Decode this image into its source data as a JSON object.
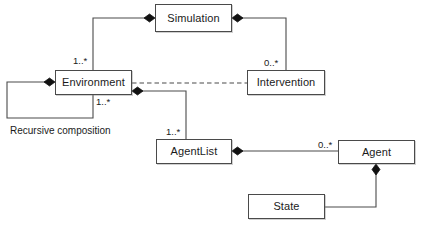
{
  "diagram": {
    "kind": "uml-class-diagram",
    "width": 423,
    "height": 228,
    "background_color": "#ffffff",
    "line_color": "#4a4a4a",
    "text_color": "#1a1a1a",
    "classes": [
      {
        "id": "simulation",
        "name": "Simulation",
        "x": 155,
        "y": 4,
        "w": 77,
        "h": 28
      },
      {
        "id": "environment",
        "name": "Environment",
        "x": 55,
        "y": 70,
        "w": 77,
        "h": 25
      },
      {
        "id": "intervention",
        "name": "Intervention",
        "x": 247,
        "y": 70,
        "w": 78,
        "h": 25
      },
      {
        "id": "agentlist",
        "name": "AgentList",
        "x": 156,
        "y": 139,
        "w": 76,
        "h": 25
      },
      {
        "id": "agent",
        "name": "Agent",
        "x": 338,
        "y": 140,
        "w": 77,
        "h": 24
      },
      {
        "id": "state",
        "name": "State",
        "x": 248,
        "y": 194,
        "w": 77,
        "h": 25
      }
    ],
    "multiplicities": [
      {
        "id": "sim-env",
        "text": "1..*",
        "x": 73,
        "y": 56
      },
      {
        "id": "sim-interv",
        "text": "0..*",
        "x": 264,
        "y": 58
      },
      {
        "id": "env-recursive",
        "text": "1..*",
        "x": 96,
        "y": 97
      },
      {
        "id": "env-agentlist",
        "text": "1..*",
        "x": 166,
        "y": 127
      },
      {
        "id": "agentlist-agent",
        "text": "0..*",
        "x": 318,
        "y": 140
      }
    ],
    "annotations": [
      {
        "id": "recursive-composition",
        "text": "Recursive composition",
        "x": 10,
        "y": 126
      }
    ],
    "relationships": [
      {
        "id": "simulation-environment",
        "type": "composition",
        "from": "simulation",
        "to": "environment",
        "diamond_at": "simulation"
      },
      {
        "id": "simulation-intervention",
        "type": "composition",
        "from": "simulation",
        "to": "intervention",
        "diamond_at": "simulation"
      },
      {
        "id": "environment-recursive",
        "type": "composition",
        "from": "environment",
        "to": "environment",
        "diamond_at": "environment"
      },
      {
        "id": "environment-intervention",
        "type": "dependency",
        "from": "environment",
        "to": "intervention",
        "style": "dashed"
      },
      {
        "id": "environment-agentlist",
        "type": "composition",
        "from": "environment",
        "to": "agentlist",
        "diamond_at": "environment"
      },
      {
        "id": "agentlist-agent",
        "type": "composition",
        "from": "agentlist",
        "to": "agent",
        "diamond_at": "agentlist"
      },
      {
        "id": "agent-state",
        "type": "composition",
        "from": "agent",
        "to": "state",
        "diamond_at": "agent"
      }
    ]
  }
}
